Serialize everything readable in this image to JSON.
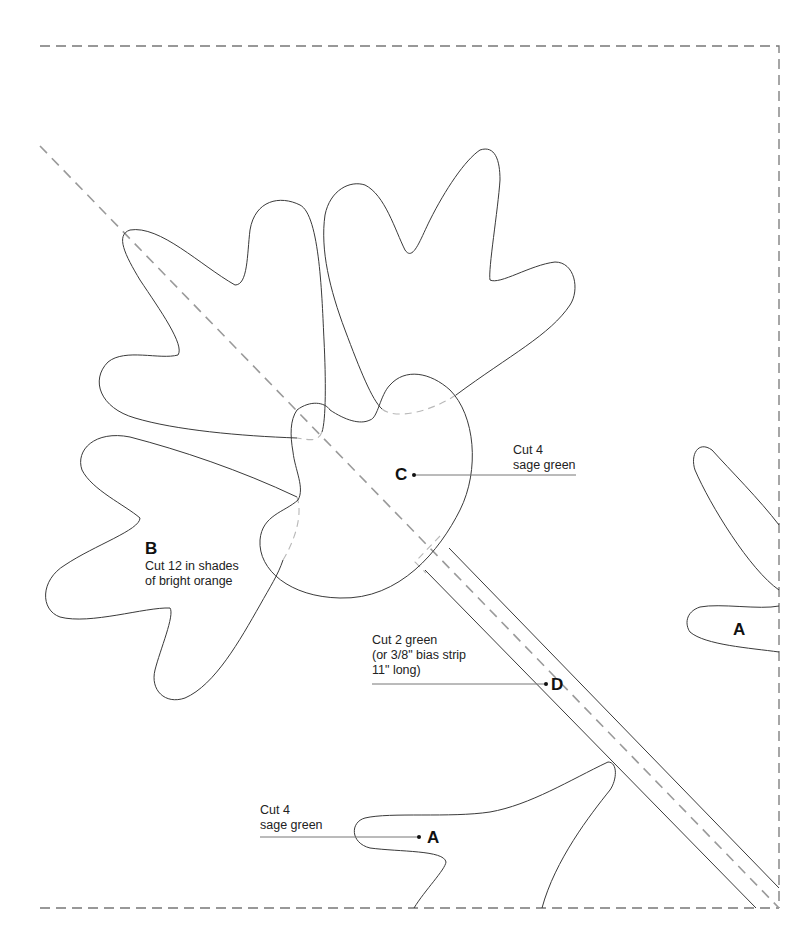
{
  "diagram": {
    "type": "applique-quilt-template",
    "border": {
      "style": "dashed",
      "color": "#777777"
    },
    "fold_line": {
      "style": "dashed-diagonal",
      "color": "#9a9a9a"
    },
    "outline_color": "#3a3a3a"
  },
  "pieces": {
    "A": {
      "letter": "A",
      "count_line": "Cut 4",
      "fabric_line": "sage green"
    },
    "A_right": {
      "letter": "A"
    },
    "B": {
      "letter": "B",
      "line1": "Cut 12 in shades",
      "line2": "of bright orange"
    },
    "C": {
      "letter": "C",
      "count_line": "Cut 4",
      "fabric_line": "sage green"
    },
    "D": {
      "letter": "D",
      "line1": "Cut 2 green",
      "line2": "(or 3/8\" bias strip",
      "line3": "11\" long)"
    }
  }
}
